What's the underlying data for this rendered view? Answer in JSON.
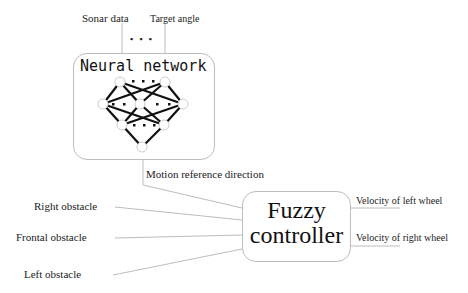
{
  "inputs_top": {
    "sonar": "Sonar data",
    "target": "Target angle",
    "ellipsis": "• • •"
  },
  "neural_network": {
    "title": "Neural network"
  },
  "connector": {
    "motion": "Motion reference direction"
  },
  "fuzzy": {
    "line1": "Fuzzy",
    "line2": "controller"
  },
  "left_inputs": [
    "Right obstacle",
    "Frontal obstacle",
    "Left obstacle"
  ],
  "outputs": [
    "Velocity of  left wheel",
    "Velocity of right wheel"
  ],
  "colors": {
    "lines": "#bdbdbd",
    "network_edges": "#111111",
    "text": "#222222"
  }
}
